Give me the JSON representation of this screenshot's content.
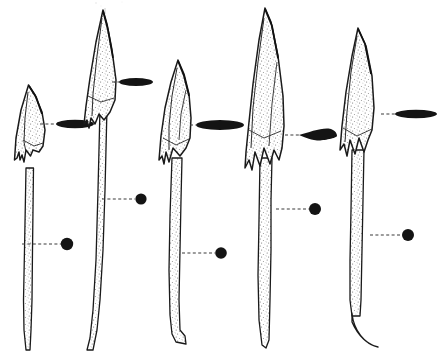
{
  "figure": {
    "technique": "stipple-and-line archaeological ink drawing",
    "background_color": "#ffffff",
    "ink_color": "#1a1a1a",
    "stipple_color": "#6a6a6a",
    "leader_line_style": "dashed",
    "object_count": 5,
    "caption": ""
  },
  "objects": [
    {
      "id": "spearhead-1",
      "index": 1,
      "label": "1",
      "blade_shape": "short leaf-shaped blade with flared shoulders",
      "has_barbs": true,
      "barb_count": 2,
      "tip_x": 28,
      "tip_y": 85,
      "blade_max_width": 30,
      "blade_bottom_y": 172,
      "shaft_top_y": 172,
      "shaft_bottom_y": 345,
      "shaft_width": 8,
      "shaft_tip_style": "tapered-point",
      "blade_section": {
        "marker_name": "lenticular-section-marker",
        "shape": "lens",
        "cx": 75,
        "cy": 124,
        "rx": 19,
        "ry": 4.2,
        "leader_from_x": 40,
        "leader_to_x": 56
      },
      "shaft_section": {
        "marker_name": "circular-section-marker",
        "shape": "circle",
        "cx": 67,
        "cy": 244,
        "r": 6.2,
        "leader_from_x": 22,
        "leader_to_x": 61
      }
    },
    {
      "id": "spearhead-2",
      "index": 2,
      "label": "2",
      "blade_shape": "long slender triangular blade with narrow shoulders",
      "has_barbs": true,
      "barb_count": 2,
      "tip_x": 103,
      "tip_y": 10,
      "blade_max_width": 26,
      "blade_bottom_y": 120,
      "shaft_top_y": 110,
      "shaft_bottom_y": 348,
      "shaft_width": 8,
      "shaft_tip_style": "tapered-point",
      "blade_section": {
        "marker_name": "lenticular-section-marker",
        "shape": "lens",
        "cx": 136,
        "cy": 82,
        "rx": 17,
        "ry": 4.0,
        "leader_from_x": 112,
        "leader_to_x": 119
      },
      "shaft_section": {
        "marker_name": "circular-section-marker",
        "shape": "circle",
        "cx": 141,
        "cy": 199,
        "r": 5.6,
        "leader_from_x": 102,
        "leader_to_x": 135
      }
    },
    {
      "id": "spearhead-3",
      "index": 3,
      "label": "3",
      "blade_shape": "broad leaf-shaped blade with heavy midrib",
      "has_barbs": true,
      "barb_count": 2,
      "tip_x": 178,
      "tip_y": 60,
      "blade_max_width": 32,
      "blade_bottom_y": 165,
      "shaft_top_y": 160,
      "shaft_bottom_y": 342,
      "shaft_width": 9,
      "shaft_tip_style": "blunt-hooked",
      "blade_section": {
        "marker_name": "lenticular-section-marker",
        "shape": "lens",
        "cx": 220,
        "cy": 125,
        "rx": 24,
        "ry": 5.0,
        "leader_from_x": 190,
        "leader_to_x": 196
      },
      "shaft_section": {
        "marker_name": "circular-section-marker",
        "shape": "circle",
        "cx": 221,
        "cy": 253,
        "r": 5.8,
        "leader_from_x": 182,
        "leader_to_x": 215
      }
    },
    {
      "id": "spearhead-4",
      "index": 4,
      "label": "4",
      "blade_shape": "very long barbed blade with pronounced wings",
      "has_barbs": true,
      "barb_count": 2,
      "tip_x": 265,
      "tip_y": 8,
      "blade_max_width": 34,
      "blade_bottom_y": 168,
      "shaft_top_y": 160,
      "shaft_bottom_y": 345,
      "shaft_width": 9,
      "shaft_tip_style": "tapered-point",
      "blade_section": {
        "marker_name": "rhomboid-section-marker",
        "shape": "rhomboid-lens",
        "cx": 318,
        "cy": 135,
        "rx": 19,
        "ry": 5.6,
        "leader_from_x": 285,
        "leader_to_x": 299
      },
      "shaft_section": {
        "marker_name": "circular-section-marker",
        "shape": "circle",
        "cx": 315,
        "cy": 209,
        "r": 6.0,
        "leader_from_x": 276,
        "leader_to_x": 309
      }
    },
    {
      "id": "spearhead-5",
      "index": 5,
      "label": "5",
      "blade_shape": "narrow elongated blade with small barbs",
      "has_barbs": true,
      "barb_count": 2,
      "tip_x": 358,
      "tip_y": 28,
      "blade_max_width": 30,
      "blade_bottom_y": 158,
      "shaft_top_y": 150,
      "shaft_bottom_y": 318,
      "shaft_width": 9,
      "shaft_tip_style": "curved-hook",
      "blade_section": {
        "marker_name": "lenticular-section-marker",
        "shape": "lens",
        "cx": 416,
        "cy": 114,
        "rx": 21,
        "ry": 4.2,
        "leader_from_x": 381,
        "leader_to_x": 395
      },
      "shaft_section": {
        "marker_name": "circular-section-marker",
        "shape": "circle",
        "cx": 408,
        "cy": 235,
        "r": 6.0,
        "leader_from_x": 370,
        "leader_to_x": 402
      }
    }
  ]
}
